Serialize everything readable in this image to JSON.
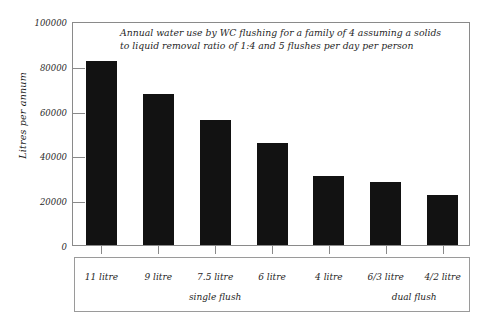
{
  "chart_data": {
    "type": "bar",
    "title": "Annual water use by WC flushing for a family of 4 assuming a solids to liquid removal ratio of 1:4 and 5 flushes per day per person",
    "title_line1": "Annual water use by WC flushing for a family of 4 assuming a solids",
    "title_line2": "to liquid removal ratio of 1:4 and 5 flushes per day per person",
    "xlabel": "",
    "ylabel": "Litres per annum",
    "categories": [
      "11 litre",
      "9 litre",
      "7.5 litre",
      "6 litre",
      "4 litre",
      "6/3 litre",
      "4/2 litre"
    ],
    "values": [
      82000,
      67500,
      56000,
      45500,
      31000,
      28000,
      22500
    ],
    "ylim": [
      0,
      100000
    ],
    "ytick_labels": [
      "100000",
      "80000",
      "60000",
      "40000",
      "20000",
      "0"
    ],
    "ytick_values": [
      100000,
      80000,
      60000,
      40000,
      20000,
      0
    ],
    "grid": false,
    "legend": "none",
    "bar_color": "#121212",
    "axis_color": "#8a8a8a",
    "groups": [
      {
        "label": "single flush",
        "categories": [
          "11 litre",
          "9 litre",
          "7.5 litre",
          "6 litre",
          "4 litre"
        ]
      },
      {
        "label": "dual flush",
        "categories": [
          "6/3 litre",
          "4/2 litre"
        ]
      }
    ],
    "group_labels": [
      "single flush",
      "dual flush"
    ]
  }
}
